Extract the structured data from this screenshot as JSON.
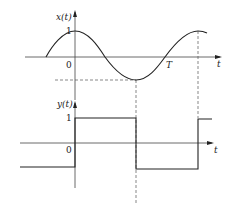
{
  "top_plot": {
    "y_label": "x(t)",
    "x_label": "t",
    "tick_one": "1",
    "origin": "0",
    "period_label": "T",
    "curve": "cosine",
    "description": "x(t) = cos(2πt/T) sinusoid starting left of origin, peak 1 at t=0, minimum at T/2, zero crossing near 3T/4 labeled T, peak again at T"
  },
  "bottom_plot": {
    "y_label": "y(t)",
    "x_label": "t",
    "tick_one": "1",
    "origin": "0",
    "waveform": "square",
    "levels": [
      -1,
      1,
      -1,
      1
    ],
    "description": "square wave y(t): -1 for t<0, +1 from 0 to T/2, -1 from T/2 to T, +1 after T"
  },
  "colors": {
    "stroke": "#222222",
    "axis": "#444444",
    "dashed": "#555555"
  }
}
